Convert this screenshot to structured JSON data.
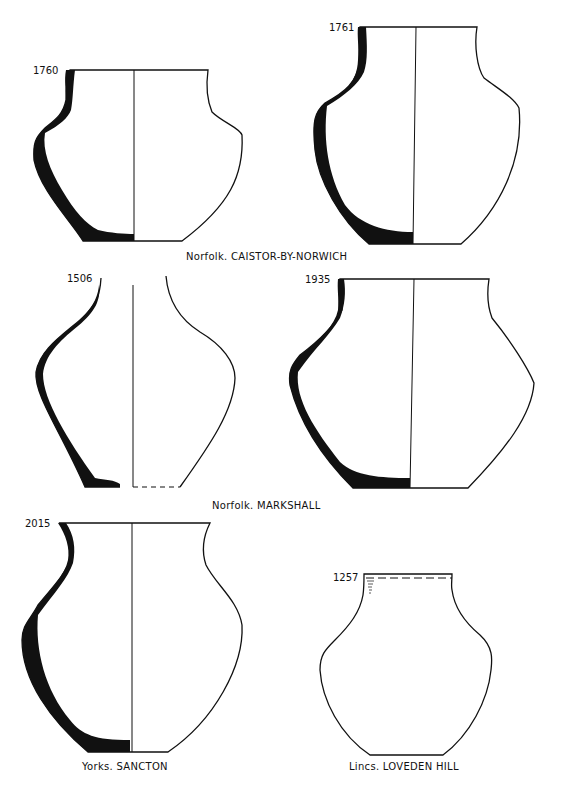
{
  "plate": {
    "vessels": [
      {
        "id": "1760",
        "group": "caistor",
        "position": "top-left"
      },
      {
        "id": "1761",
        "group": "caistor",
        "position": "top-right"
      },
      {
        "id": "1506",
        "group": "markshall",
        "position": "middle-left"
      },
      {
        "id": "1935",
        "group": "markshall",
        "position": "middle-right"
      },
      {
        "id": "2015",
        "group": "sancton",
        "position": "bottom-left"
      },
      {
        "id": "1257",
        "group": "loveden",
        "position": "bottom-right"
      }
    ],
    "captions": {
      "caistor": "Norfolk. CAISTOR-BY-NORWICH",
      "markshall": "Norfolk. MARKSHALL",
      "sancton": "Yorks. SANCTON",
      "loveden": "Lincs. LOVEDEN HILL"
    },
    "colors": {
      "ink": "#111111",
      "paper": "#ffffff"
    }
  }
}
